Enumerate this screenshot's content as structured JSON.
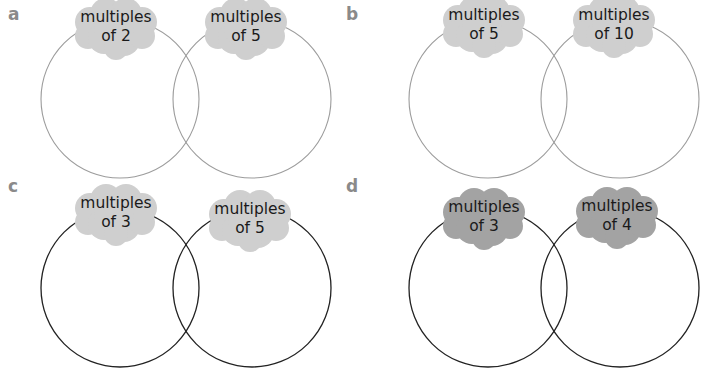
{
  "colors": {
    "cloud_light": "#cfcfcf",
    "cloud_dark": "#a3a3a3",
    "circle_light": "#9c9c9c",
    "circle_dark": "#222222",
    "label": "#8a8a8a"
  },
  "panels": [
    {
      "label": "a",
      "label_pos": [
        8,
        4
      ],
      "stroke": "light",
      "sets": [
        {
          "line1": "multiples",
          "line2": "of 2",
          "cx": 120,
          "cy": 99,
          "r": 79,
          "cloud": [
            116,
            28
          ]
        },
        {
          "line1": "multiples",
          "line2": "of 5",
          "cx": 252,
          "cy": 99,
          "r": 79,
          "cloud": [
            246,
            28
          ]
        }
      ]
    },
    {
      "label": "b",
      "label_pos": [
        346,
        4
      ],
      "stroke": "light",
      "sets": [
        {
          "line1": "multiples",
          "line2": "of 5",
          "cx": 488,
          "cy": 99,
          "r": 79,
          "cloud": [
            484,
            26
          ]
        },
        {
          "line1": "multiples",
          "line2": "of 10",
          "cx": 620,
          "cy": 99,
          "r": 79,
          "cloud": [
            614,
            26
          ]
        }
      ]
    },
    {
      "label": "c",
      "label_pos": [
        8,
        176
      ],
      "stroke": "dark",
      "sets": [
        {
          "line1": "multiples",
          "line2": "of 3",
          "cx": 120,
          "cy": 288,
          "r": 79,
          "cloud": [
            116,
            214
          ]
        },
        {
          "line1": "multiples",
          "line2": "of 5",
          "cx": 252,
          "cy": 288,
          "r": 79,
          "cloud": [
            250,
            220
          ]
        }
      ]
    },
    {
      "label": "d",
      "label_pos": [
        346,
        176
      ],
      "stroke": "dark",
      "cloud_shade": "dark",
      "sets": [
        {
          "line1": "multiples",
          "line2": "of 3",
          "cx": 488,
          "cy": 288,
          "r": 79,
          "cloud": [
            484,
            218
          ]
        },
        {
          "line1": "multiples",
          "line2": "of 4",
          "cx": 620,
          "cy": 288,
          "r": 79,
          "cloud": [
            617,
            217
          ]
        }
      ]
    }
  ]
}
